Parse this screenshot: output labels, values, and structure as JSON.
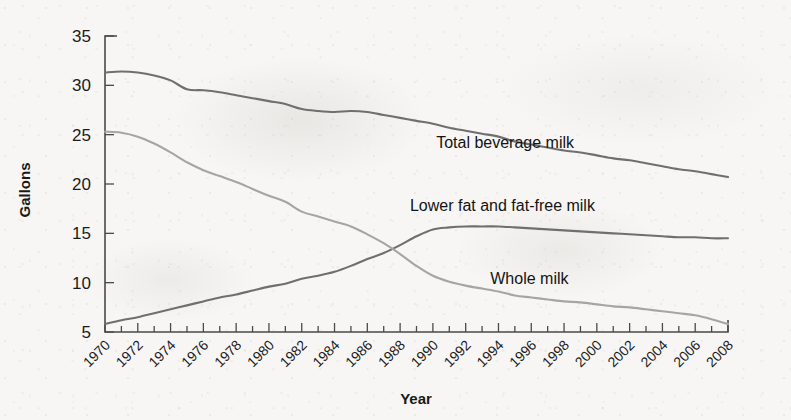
{
  "figure": {
    "background_color": "#f7f6f4",
    "axis_color": "#4a4a4a"
  },
  "chart_data": {
    "type": "line",
    "title": "",
    "subtitle": "",
    "xlabel": "Year",
    "ylabel": "Gallons",
    "xlim": [
      1970,
      2008
    ],
    "ylim": [
      5,
      35
    ],
    "grid": false,
    "legend_position": "inline-annotations",
    "x_tick_labels": [
      "1970",
      "1972",
      "1974",
      "1976",
      "1978",
      "1980",
      "1982",
      "1984",
      "1986",
      "1988",
      "1990",
      "1992",
      "1994",
      "1996",
      "1998",
      "2000",
      "2002",
      "2004",
      "2006",
      "2008"
    ],
    "y_tick_labels": [
      "5",
      "10",
      "15",
      "20",
      "25",
      "30",
      "35"
    ],
    "y_ticks": [
      5,
      10,
      15,
      20,
      25,
      30,
      35
    ],
    "x_tick_rotation_deg": 45,
    "x_minor_tick_interval_years": 1,
    "x": [
      1970,
      1971,
      1972,
      1973,
      1974,
      1975,
      1976,
      1977,
      1978,
      1979,
      1980,
      1981,
      1982,
      1983,
      1984,
      1985,
      1986,
      1987,
      1988,
      1989,
      1990,
      1991,
      1992,
      1993,
      1994,
      1995,
      1996,
      1997,
      1998,
      1999,
      2000,
      2001,
      2002,
      2003,
      2004,
      2005,
      2006,
      2007,
      2008
    ],
    "series": [
      {
        "name": "Total beverage milk",
        "color": "#6f6f6f",
        "label_x": 1990.2,
        "label_y": 23.6,
        "values": [
          31.3,
          31.4,
          31.3,
          31.0,
          30.5,
          29.6,
          29.5,
          29.3,
          29.0,
          28.7,
          28.4,
          28.1,
          27.6,
          27.4,
          27.3,
          27.4,
          27.3,
          27.0,
          26.7,
          26.4,
          26.1,
          25.7,
          25.4,
          25.1,
          24.8,
          24.3,
          24.0,
          23.7,
          23.4,
          23.2,
          22.9,
          22.6,
          22.4,
          22.1,
          21.8,
          21.5,
          21.3,
          21.0,
          20.7
        ]
      },
      {
        "name": "Lower fat and fat-free milk",
        "color": "#6f6f6f",
        "label_x": 1988.6,
        "label_y": 17.3,
        "values": [
          5.8,
          6.2,
          6.5,
          6.9,
          7.3,
          7.7,
          8.1,
          8.5,
          8.8,
          9.2,
          9.6,
          9.9,
          10.4,
          10.7,
          11.1,
          11.7,
          12.4,
          13.0,
          13.8,
          14.7,
          15.4,
          15.6,
          15.7,
          15.7,
          15.7,
          15.6,
          15.5,
          15.4,
          15.3,
          15.2,
          15.1,
          15.0,
          14.9,
          14.8,
          14.7,
          14.6,
          14.6,
          14.5,
          14.5
        ]
      },
      {
        "name": "Whole milk",
        "color": "#a5a5a5",
        "label_x": 1993.5,
        "label_y": 9.9,
        "values": [
          25.3,
          25.2,
          24.8,
          24.1,
          23.2,
          22.2,
          21.4,
          20.8,
          20.2,
          19.5,
          18.8,
          18.2,
          17.2,
          16.7,
          16.2,
          15.7,
          14.9,
          14.0,
          12.9,
          11.7,
          10.7,
          10.1,
          9.7,
          9.4,
          9.1,
          8.7,
          8.5,
          8.3,
          8.1,
          8.0,
          7.8,
          7.6,
          7.5,
          7.3,
          7.1,
          6.9,
          6.7,
          6.3,
          5.8
        ]
      }
    ]
  }
}
